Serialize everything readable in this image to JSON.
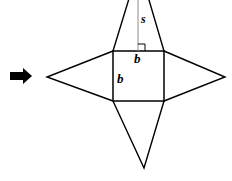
{
  "figure": {
    "colors": {
      "stroke": "#000000",
      "altitude_stroke": "#8c8c8c",
      "arrow_fill": "#000000",
      "background": "#ffffff"
    },
    "arrow": {
      "name": "right-pointing-arrow",
      "direction": "right"
    },
    "square": {
      "name": "base-square",
      "left": 113,
      "top": 51,
      "right": 164,
      "bottom": 101
    },
    "apexes": {
      "top": {
        "x": 139,
        "y": -34
      },
      "bottom": {
        "x": 144,
        "y": 168
      },
      "left": {
        "x": 47,
        "y": 77
      },
      "right": {
        "x": 225,
        "y": 77
      }
    },
    "labels": {
      "slant_height": "s",
      "base_top": "b",
      "base_left": "b"
    },
    "markers": {
      "right_angle": "right-angle-marker"
    }
  }
}
